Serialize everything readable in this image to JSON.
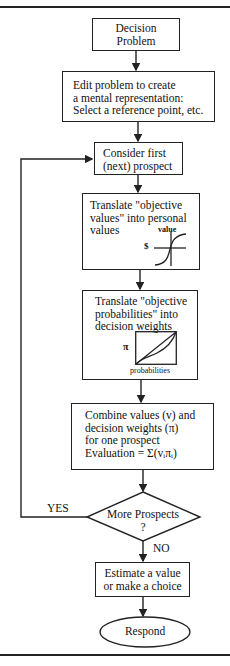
{
  "diagram": {
    "type": "flowchart",
    "nodes": {
      "decision_problem": {
        "line1": "Decision",
        "line2": "Problem"
      },
      "edit": {
        "line1": "Edit problem to create",
        "line2": "a mental representation:",
        "line3": "Select a reference point, etc."
      },
      "consider": {
        "line1": "Consider first",
        "line2": "(next) prospect"
      },
      "translate_values": {
        "line1": "Translate \"objective",
        "line2": "values\" into personal",
        "line3": "values",
        "graph_y_label": "value",
        "graph_x_label": "$"
      },
      "translate_probs": {
        "line1": "Translate \"objective",
        "line2": "probabilities\" into",
        "line3": "decision weights",
        "graph_y_label": "π",
        "graph_x_label": "probabilities"
      },
      "combine": {
        "line1": "Combine values (v) and",
        "line2": "decision weights (π)",
        "line3": "for one prospect",
        "line4": "Evaluation = Σ(vᵢπᵢ)"
      },
      "more_prospects": {
        "line1": "More Prospects",
        "line2": "?"
      },
      "estimate": {
        "line1": "Estimate a value",
        "line2": "or make a choice"
      },
      "respond": {
        "label": "Respond"
      }
    },
    "edges": {
      "yes_label": "YES",
      "no_label": "NO"
    }
  }
}
